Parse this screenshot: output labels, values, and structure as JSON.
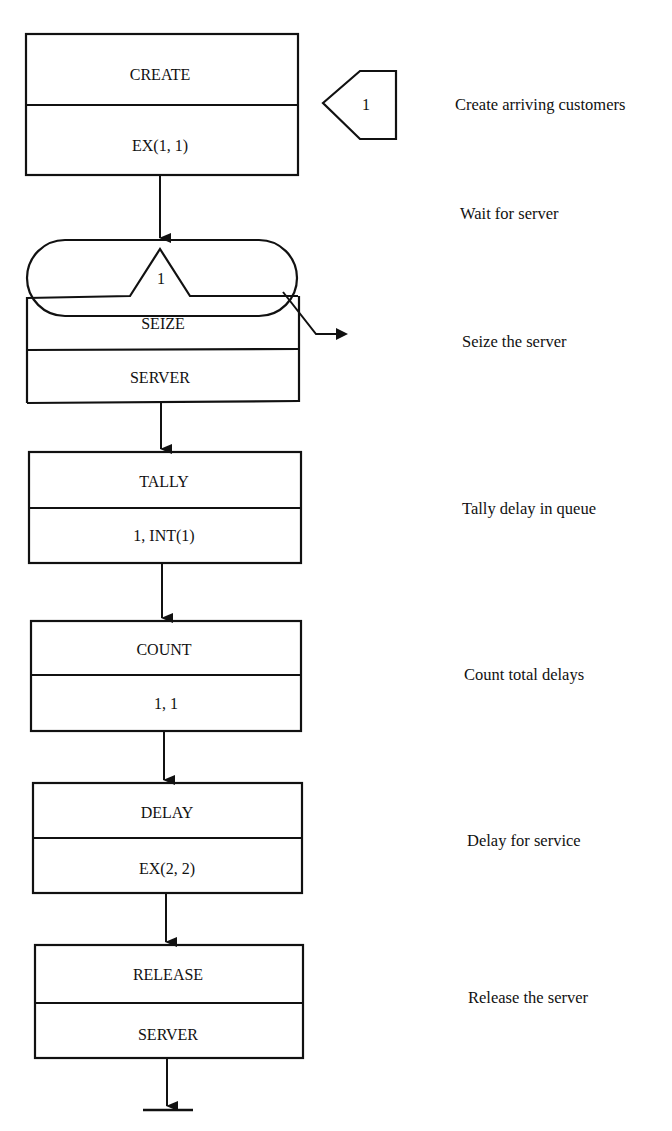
{
  "diagram": {
    "stroke_color": "#111111",
    "background": "#ffffff",
    "create_block": {
      "top": "CREATE",
      "bottom": "EX(1, 1)",
      "label_node": "1",
      "description": "Create arriving customers"
    },
    "queue_node": {
      "label": "1",
      "description": "Wait for server"
    },
    "blocks": [
      {
        "top": "SEIZE",
        "bottom": "SERVER",
        "description": "Seize the server"
      },
      {
        "top": "TALLY",
        "bottom": "1, INT(1)",
        "description": "Tally delay in queue"
      },
      {
        "top": "COUNT",
        "bottom": "1, 1",
        "description": "Count total delays"
      },
      {
        "top": "DELAY",
        "bottom": "EX(2, 2)",
        "description": "Delay for service"
      },
      {
        "top": "RELEASE",
        "bottom": "SERVER",
        "description": "Release the server"
      }
    ]
  }
}
